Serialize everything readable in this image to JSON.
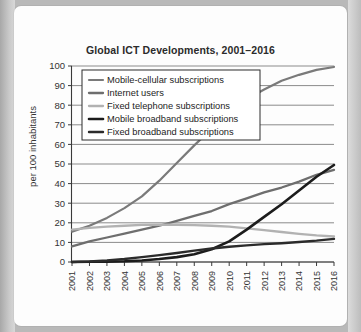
{
  "chart_data": {
    "type": "line",
    "title": "Global ICT Developments, 2001–2016",
    "xlabel": "",
    "ylabel": "per 100 inhabitants",
    "ylim": [
      0,
      100
    ],
    "yticks": [
      0,
      10,
      20,
      30,
      40,
      50,
      60,
      70,
      80,
      90,
      100
    ],
    "grid": true,
    "legend_position": "upper-left-inside",
    "categories": [
      "2001",
      "2002",
      "2003",
      "2004",
      "2005",
      "2006",
      "2007",
      "2008",
      "2009",
      "2010",
      "2011",
      "2012",
      "2013",
      "2014",
      "2015",
      "2016"
    ],
    "series": [
      {
        "name": "Mobile-cellular subscriptions",
        "color": "#7a7a7a",
        "width": 2.2,
        "values": [
          15.5,
          18.5,
          22.5,
          27.5,
          33.5,
          41.5,
          50.5,
          59.5,
          68.0,
          76.5,
          83.0,
          88.0,
          92.5,
          95.5,
          98.0,
          99.5
        ]
      },
      {
        "name": "Internet users",
        "color": "#6e6e6e",
        "width": 2.3,
        "values": [
          8.0,
          10.5,
          12.5,
          14.5,
          16.5,
          18.5,
          21.0,
          23.5,
          26.0,
          29.5,
          32.5,
          35.5,
          38.0,
          41.0,
          44.5,
          47.0
        ]
      },
      {
        "name": "Fixed telephone subscriptions",
        "color": "#b2b2b2",
        "width": 2.3,
        "values": [
          16.5,
          17.4,
          18.0,
          18.5,
          18.9,
          19.0,
          19.0,
          18.8,
          18.5,
          18.0,
          17.2,
          16.3,
          15.3,
          14.4,
          13.6,
          13.0
        ]
      },
      {
        "name": "Mobile broadband subscriptions",
        "color": "#1c1c1c",
        "width": 2.6,
        "values": [
          0.0,
          0.1,
          0.2,
          0.4,
          0.8,
          1.5,
          2.5,
          4.0,
          6.5,
          10.5,
          16.5,
          23.0,
          29.5,
          36.5,
          43.5,
          49.5
        ]
      },
      {
        "name": "Fixed broadband subscriptions",
        "color": "#2b2b2b",
        "width": 2.4,
        "values": [
          0.0,
          0.3,
          0.8,
          1.5,
          2.5,
          3.5,
          4.6,
          5.8,
          6.9,
          7.8,
          8.5,
          9.1,
          9.6,
          10.2,
          10.9,
          11.8
        ]
      }
    ]
  }
}
